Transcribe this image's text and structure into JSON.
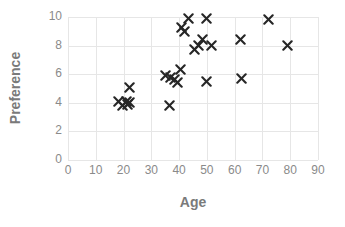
{
  "chart_data": {
    "type": "scatter",
    "title": "",
    "xlabel": "Age",
    "ylabel": "Preference",
    "xlim": [
      0,
      90
    ],
    "ylim": [
      0,
      10
    ],
    "xticks": [
      0,
      10,
      20,
      30,
      40,
      50,
      60,
      70,
      80,
      90
    ],
    "yticks": [
      0,
      2,
      4,
      6,
      8,
      10
    ],
    "grid": true,
    "legend": null,
    "marker_style": "x",
    "marker_color": "#262626",
    "series": [
      {
        "name": "Age vs Preference",
        "points": [
          {
            "x": 18,
            "y": 4.1
          },
          {
            "x": 19.5,
            "y": 3.8
          },
          {
            "x": 21,
            "y": 4.1
          },
          {
            "x": 21.5,
            "y": 3.9
          },
          {
            "x": 22,
            "y": 4.0
          },
          {
            "x": 22,
            "y": 5.1
          },
          {
            "x": 36.5,
            "y": 3.8
          },
          {
            "x": 35,
            "y": 5.9
          },
          {
            "x": 37,
            "y": 5.8
          },
          {
            "x": 38.5,
            "y": 5.6
          },
          {
            "x": 39.5,
            "y": 5.4
          },
          {
            "x": 40.5,
            "y": 6.3
          },
          {
            "x": 41,
            "y": 9.3
          },
          {
            "x": 42,
            "y": 9.0
          },
          {
            "x": 43.5,
            "y": 9.9
          },
          {
            "x": 45.5,
            "y": 7.7
          },
          {
            "x": 47,
            "y": 8.0
          },
          {
            "x": 48.5,
            "y": 8.4
          },
          {
            "x": 50,
            "y": 9.9
          },
          {
            "x": 51.5,
            "y": 8.0
          },
          {
            "x": 50,
            "y": 5.5
          },
          {
            "x": 62,
            "y": 8.4
          },
          {
            "x": 62.5,
            "y": 5.7
          },
          {
            "x": 72,
            "y": 9.8
          },
          {
            "x": 79,
            "y": 8.0
          }
        ]
      }
    ]
  },
  "axes": {
    "x_title": "Age",
    "y_title": "Preference"
  }
}
